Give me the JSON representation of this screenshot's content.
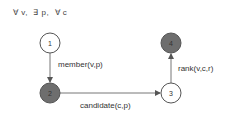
{
  "quantifiers": "∀ v,  ∃ p,  ∀ c",
  "nodes": [
    {
      "id": "1",
      "label": "1",
      "x": 50,
      "y": 43,
      "filled": false
    },
    {
      "id": "2",
      "label": "2",
      "x": 50,
      "y": 93,
      "filled": true
    },
    {
      "id": "3",
      "label": "3",
      "x": 171,
      "y": 93,
      "filled": false
    },
    {
      "id": "4",
      "label": "4",
      "x": 171,
      "y": 43,
      "filled": true
    }
  ],
  "edges": [
    {
      "from": "1",
      "to": "2",
      "label": "member(v,p)"
    },
    {
      "from": "2",
      "to": "3",
      "label": "candidate(c,p)"
    },
    {
      "from": "3",
      "to": "4",
      "label": "rank(v,c,r)"
    }
  ],
  "colors": {
    "filled_node": "#6e6e6e",
    "stroke": "#555555",
    "edge": "#777777"
  }
}
